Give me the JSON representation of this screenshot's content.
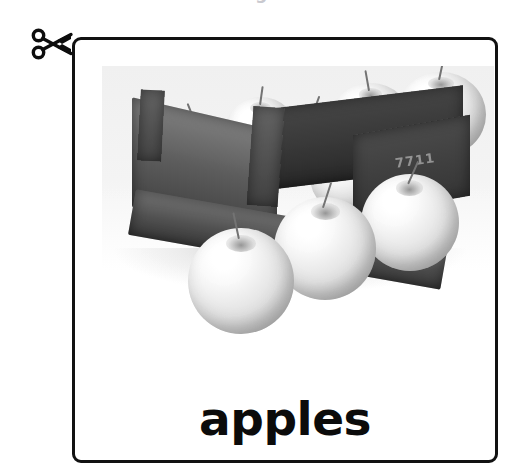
{
  "page": {
    "background_color": "#ffffff",
    "top_cutoff_text": "g"
  },
  "cut_marker": {
    "icon": "scissors-icon",
    "label": "cut along the line",
    "color": "#0d0d0d"
  },
  "flashcard": {
    "border_color": "#111111",
    "background_color": "#ffffff",
    "label": "apples",
    "label_color": "#0b0b0b",
    "photo": {
      "name": "apples-in-wooden-crate-photo",
      "alt": "Black and white photograph of apples in a wooden crate",
      "color_mode": "grayscale",
      "subject": "apples",
      "container": "wooden crate",
      "crate_marking": "7711"
    }
  }
}
